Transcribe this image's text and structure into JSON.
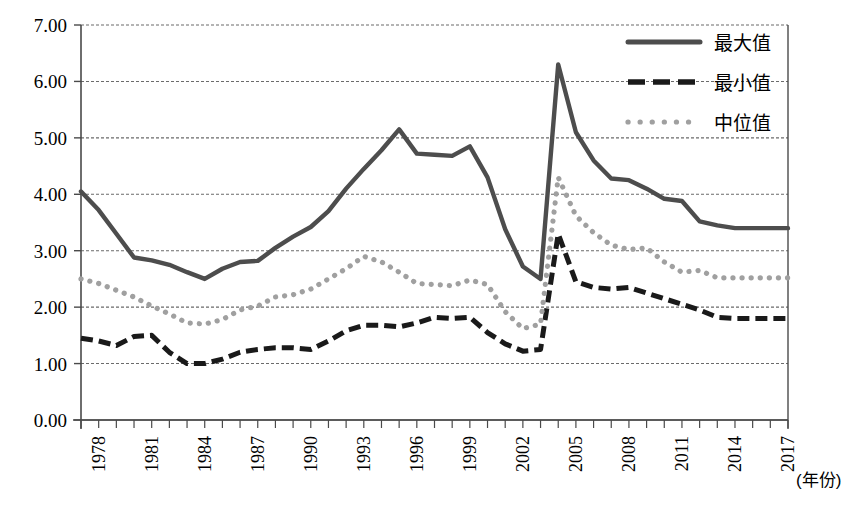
{
  "chart_data": {
    "type": "line",
    "title": "",
    "xlabel": "(年份)",
    "ylabel": "",
    "ylim": [
      0,
      7
    ],
    "ytick_labels": [
      "0.00",
      "1.00",
      "2.00",
      "3.00",
      "4.00",
      "5.00",
      "6.00",
      "7.00"
    ],
    "ytick_values": [
      0,
      1,
      2,
      3,
      4,
      5,
      6,
      7
    ],
    "grid": true,
    "legend_position": "top-right",
    "xlim": [
      1977,
      2017
    ],
    "x": [
      1977,
      1978,
      1979,
      1980,
      1981,
      1982,
      1983,
      1984,
      1985,
      1986,
      1987,
      1988,
      1989,
      1990,
      1991,
      1992,
      1993,
      1994,
      1995,
      1996,
      1997,
      1998,
      1999,
      2000,
      2001,
      2002,
      2003,
      2004,
      2005,
      2006,
      2007,
      2008,
      2009,
      2010,
      2011,
      2012,
      2013,
      2014,
      2015,
      2016,
      2017
    ],
    "xtick_labels": [
      "1978",
      "1981",
      "1984",
      "1987",
      "1990",
      "1993",
      "1996",
      "1999",
      "2002",
      "2005",
      "2008",
      "2011",
      "2014",
      "2017"
    ],
    "xtick_values": [
      1978,
      1981,
      1984,
      1987,
      1990,
      1993,
      1996,
      1999,
      2002,
      2005,
      2008,
      2011,
      2014,
      2017
    ],
    "series": [
      {
        "name": "最大值",
        "style": "solid",
        "color": "#4d4d4d",
        "values": [
          4.05,
          3.72,
          3.3,
          2.88,
          2.83,
          2.75,
          2.62,
          2.5,
          2.68,
          2.8,
          2.82,
          3.05,
          3.25,
          3.42,
          3.7,
          4.1,
          4.45,
          4.78,
          5.15,
          4.72,
          4.7,
          4.68,
          4.85,
          4.3,
          3.38,
          2.72,
          2.5,
          6.3,
          5.1,
          4.6,
          4.28,
          4.25,
          4.1,
          3.92,
          3.88,
          3.52,
          3.45,
          3.4,
          3.4,
          3.4,
          3.4
        ]
      },
      {
        "name": "最小值",
        "style": "dashed",
        "color": "#1a1a1a",
        "values": [
          1.45,
          1.4,
          1.32,
          1.48,
          1.5,
          1.2,
          1.0,
          1.0,
          1.08,
          1.2,
          1.25,
          1.28,
          1.28,
          1.25,
          1.4,
          1.58,
          1.68,
          1.68,
          1.65,
          1.72,
          1.82,
          1.8,
          1.82,
          1.55,
          1.35,
          1.22,
          1.25,
          3.3,
          2.45,
          2.35,
          2.32,
          2.35,
          2.25,
          2.15,
          2.05,
          1.95,
          1.82,
          1.8,
          1.8,
          1.8,
          1.8
        ]
      },
      {
        "name": "中位值",
        "style": "dotted",
        "color": "#a0a0a0",
        "values": [
          2.5,
          2.42,
          2.3,
          2.18,
          2.02,
          1.88,
          1.72,
          1.7,
          1.78,
          1.95,
          2.02,
          2.18,
          2.22,
          2.32,
          2.5,
          2.68,
          2.9,
          2.8,
          2.62,
          2.42,
          2.4,
          2.38,
          2.48,
          2.4,
          1.92,
          1.62,
          1.7,
          4.3,
          3.62,
          3.32,
          3.1,
          3.02,
          3.05,
          2.8,
          2.62,
          2.65,
          2.52,
          2.52,
          2.52,
          2.52,
          2.52
        ]
      }
    ]
  },
  "axis": {
    "x_axis_title": "(年份)"
  },
  "legend": {
    "items": [
      {
        "label": "最大值",
        "style": "solid"
      },
      {
        "label": "最小值",
        "style": "dashed"
      },
      {
        "label": "中位值",
        "style": "dotted"
      }
    ]
  }
}
